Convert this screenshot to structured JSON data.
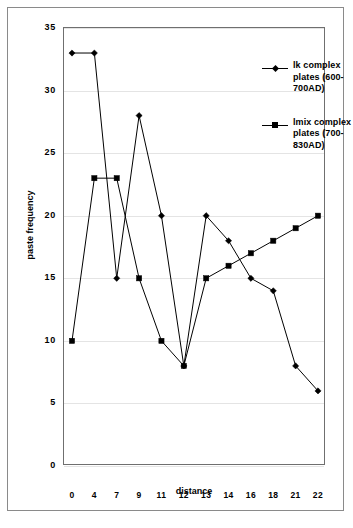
{
  "chart_data": {
    "type": "line",
    "title": "",
    "xlabel": "distance",
    "ylabel": "paste frequency",
    "categories": [
      "0",
      "4",
      "7",
      "9",
      "11",
      "12",
      "13",
      "14",
      "16",
      "18",
      "21",
      "22"
    ],
    "yticks": [
      "0",
      "5",
      "10",
      "15",
      "20",
      "25",
      "30",
      "35"
    ],
    "ylim": [
      0,
      35
    ],
    "grid": true,
    "legend_position": "upper-right-inside",
    "series": [
      {
        "name": "lk complex plates  (600-700AD)",
        "marker": "diamond",
        "color": "#000000",
        "values": [
          33,
          33,
          15,
          28,
          20,
          8,
          20,
          18,
          15,
          14,
          8,
          6
        ]
      },
      {
        "name": "lmix complex plates  (700-830AD)",
        "marker": "square",
        "color": "#000000",
        "values": [
          10,
          23,
          23,
          15,
          10,
          8,
          15,
          16,
          17,
          18,
          19,
          20
        ]
      }
    ]
  },
  "legend": {
    "entries": [
      {
        "line1": "lk complex",
        "line2": "plates  (600-",
        "line3": "700AD)"
      },
      {
        "line1": "lmix complex",
        "line2": "plates  (700-",
        "line3": "830AD)"
      }
    ]
  }
}
